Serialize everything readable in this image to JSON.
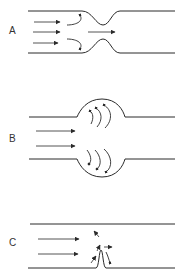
{
  "diagram": {
    "panels": [
      {
        "id": "A",
        "label": "A",
        "description": "constricted channel with recirculation upstream"
      },
      {
        "id": "B",
        "label": "B",
        "description": "dilated channel with vortices in bulge"
      },
      {
        "id": "C",
        "label": "C",
        "description": "straight channel with small wall protrusion"
      }
    ],
    "colors": {
      "line": "#2a2a2a",
      "background": "#ffffff",
      "label": "#333333"
    }
  }
}
